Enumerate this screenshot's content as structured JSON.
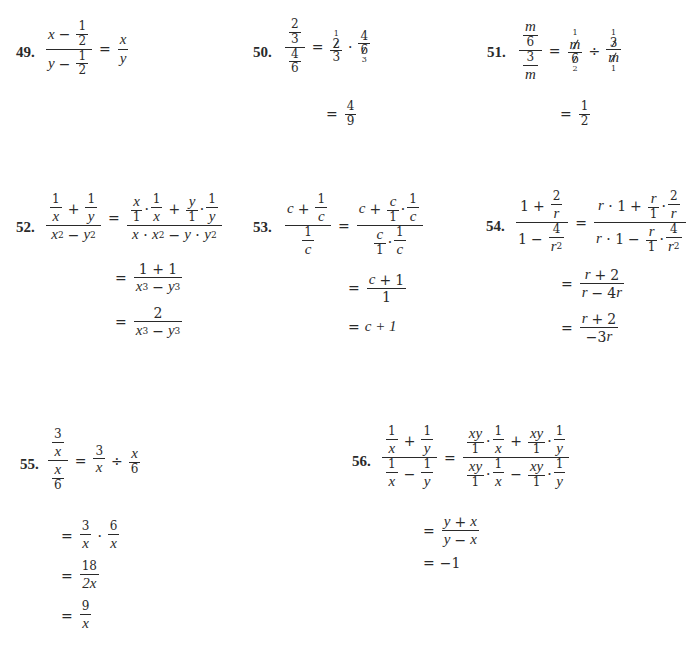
{
  "problems": {
    "p49": {
      "number": "49.",
      "lhs": {
        "num_a": "x",
        "num_op": "−",
        "num_frac": [
          "1",
          "2"
        ],
        "den_a": "y",
        "den_op": "−",
        "den_frac": [
          "1",
          "2"
        ]
      },
      "rhs": [
        "x",
        "y"
      ]
    },
    "p50": {
      "number": "50.",
      "lhs": {
        "num": [
          "2",
          "3"
        ],
        "den": [
          "4",
          "6"
        ]
      },
      "step1": {
        "f1": [
          "2",
          "3"
        ],
        "f1_cancel_top": "1",
        "op": "·",
        "f2": [
          "4",
          "6"
        ],
        "f2_cancel_bottom": "3"
      },
      "step2": [
        "4",
        "9"
      ]
    },
    "p51": {
      "number": "51.",
      "lhs": {
        "num": [
          "m",
          "6"
        ],
        "den": [
          "3",
          "m"
        ]
      },
      "step1": {
        "f1": [
          "m",
          "6"
        ],
        "f1_cancel_top": "1",
        "f1_cancel_bottom": "2",
        "op": "÷",
        "f2": [
          "3",
          "m"
        ],
        "f2_cancel_top": "1",
        "f2_cancel_bottom": "1"
      },
      "step2": [
        "1",
        "2"
      ]
    },
    "p52": {
      "number": "52.",
      "lhs": {
        "num": "1/x + 1/y",
        "den": "x² − y²"
      },
      "step1": {
        "num": "x/1 · 1/x + y/1 · 1/y",
        "den": "x · x² − y · y²"
      },
      "step2": {
        "num": "1 + 1",
        "den": "x³ − y³"
      },
      "step3": {
        "num": "2",
        "den": "x³ − y³"
      }
    },
    "p53": {
      "number": "53.",
      "lhs": {
        "num": "c + 1/c",
        "den": "1/c"
      },
      "step1": {
        "num": "c + c/1 · 1/c",
        "den": "c/1 · 1/c"
      },
      "step2": {
        "num": "c + 1",
        "den": "1"
      },
      "step3": "c + 1"
    },
    "p54": {
      "number": "54.",
      "lhs": {
        "num": "1 + 2/r",
        "den": "1 − 4/r²"
      },
      "step1": {
        "num": "r · 1 + r/1 · 2/r",
        "den": "r · 1 − r/1 · 4/r²"
      },
      "step2": {
        "num": "r + 2",
        "den": "r − 4r"
      },
      "step3": {
        "num": "r + 2",
        "den": "−3r"
      }
    },
    "p55": {
      "number": "55.",
      "lhs": {
        "num": [
          "3",
          "x"
        ],
        "den": [
          "x",
          "6"
        ]
      },
      "step1": {
        "f1": [
          "3",
          "x"
        ],
        "op": "÷",
        "f2": [
          "x",
          "6"
        ]
      },
      "step2": {
        "f1": [
          "3",
          "x"
        ],
        "op": "·",
        "f2": [
          "6",
          "x"
        ]
      },
      "step3": [
        "18",
        "2x"
      ],
      "step4": [
        "9",
        "x"
      ]
    },
    "p56": {
      "number": "56.",
      "lhs": {
        "num": "1/x + 1/y",
        "den": "1/x − 1/y"
      },
      "step1": {
        "num": "xy/1 · 1/x + xy/1 · 1/y",
        "den": "xy/1 · 1/x − xy/1 · 1/y"
      },
      "step2": {
        "num": "y + x",
        "den": "y − x"
      },
      "step3": "−1"
    }
  },
  "symbols": {
    "eq": "=",
    "plus": "+",
    "minus": "−",
    "dot": "·",
    "div": "÷",
    "one": "1",
    "two": "2",
    "three": "3",
    "four": "4",
    "six": "6",
    "x": "x",
    "y": "y",
    "c": "c",
    "r": "r",
    "m": "m",
    "xy": "xy",
    "sq": "2",
    "cube": "3"
  }
}
